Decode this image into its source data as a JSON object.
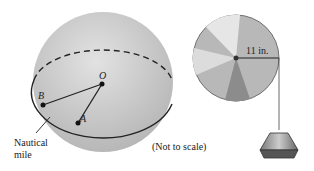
{
  "sphere": {
    "points": {
      "O": "O",
      "A": "A",
      "B": "B"
    },
    "arc_label_line1": "Nautical",
    "arc_label_line2": "mile"
  },
  "note": "(Not to scale)",
  "pulley": {
    "radius_label": "11 in."
  },
  "colors": {
    "sphere": "#c8c8c8",
    "line": "#222222",
    "disk": "#b0b0b0"
  }
}
